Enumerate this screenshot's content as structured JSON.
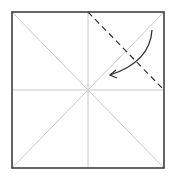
{
  "diagram": {
    "type": "origami-fold-step",
    "colors": {
      "border": "#333333",
      "crease": "#c8c8c8",
      "fold_line": "#333333",
      "arrow": "#333333",
      "background": "#ffffff"
    },
    "square": {
      "x": 12,
      "y": 12,
      "w": 152,
      "h": 156
    },
    "fold": {
      "style": "dashed",
      "from": [
        88,
        12
      ],
      "to": [
        164,
        90
      ]
    },
    "arrow": {
      "start": [
        152,
        30
      ],
      "control": [
        145,
        62
      ],
      "end": [
        110,
        75
      ],
      "direction": "fold-toward-center"
    }
  }
}
